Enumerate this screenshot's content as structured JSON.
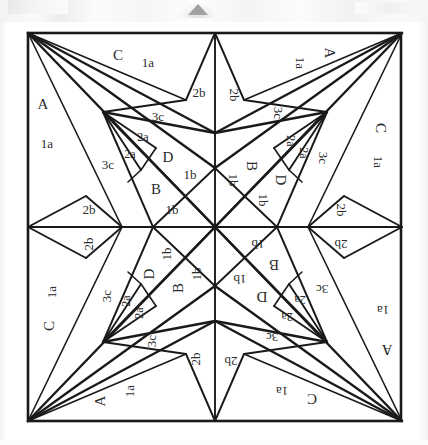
{
  "figure": {
    "square": {
      "left": 28,
      "top": 33,
      "right": 401,
      "bottom": 421
    },
    "center": {
      "x": 215,
      "y": 227
    },
    "stroke_color": "#1a1a1a",
    "label_color": "#2b2b2b",
    "background_color": "#ffffff",
    "artifact_color": "#9a9a9a"
  },
  "legend": {
    "section_letters": [
      "A",
      "B",
      "C",
      "D"
    ],
    "piece_codes": [
      "1a",
      "1b",
      "2a",
      "2b",
      "3c"
    ]
  },
  "labels": [
    {
      "id": "ul-C",
      "text": "C",
      "x": 118,
      "y": 57,
      "size": 15,
      "rot": 0
    },
    {
      "id": "ul-1a-top",
      "text": "1a",
      "x": 148,
      "y": 64,
      "size": 13,
      "rot": 0
    },
    {
      "id": "ul-2b-top",
      "text": "2b",
      "x": 199,
      "y": 94,
      "size": 13,
      "rot": 0
    },
    {
      "id": "ul-A",
      "text": "A",
      "x": 43,
      "y": 106,
      "size": 15,
      "rot": 0
    },
    {
      "id": "ul-1a-left",
      "text": "1a",
      "x": 47,
      "y": 145,
      "size": 13,
      "rot": 0
    },
    {
      "id": "ul-3c-up",
      "text": "3c",
      "x": 158,
      "y": 118,
      "size": 13,
      "rot": 0
    },
    {
      "id": "ul-2a-out",
      "text": "2a",
      "x": 143,
      "y": 138,
      "size": 12,
      "rot": 0
    },
    {
      "id": "ul-2a-in",
      "text": "2a",
      "x": 130,
      "y": 155,
      "size": 12,
      "rot": 0
    },
    {
      "id": "ul-D",
      "text": "D",
      "x": 168,
      "y": 159,
      "size": 15,
      "rot": 0
    },
    {
      "id": "ul-1b-D",
      "text": "1b",
      "x": 190,
      "y": 176,
      "size": 13,
      "rot": 0
    },
    {
      "id": "ul-3c-low",
      "text": "3c",
      "x": 108,
      "y": 166,
      "size": 13,
      "rot": 0
    },
    {
      "id": "ul-B",
      "text": "B",
      "x": 156,
      "y": 191,
      "size": 15,
      "rot": 0
    },
    {
      "id": "ul-1b-B",
      "text": "1b",
      "x": 172,
      "y": 211,
      "size": 13,
      "rot": 0
    },
    {
      "id": "ul-2b-left",
      "text": "2b",
      "x": 89,
      "y": 211,
      "size": 13,
      "rot": 0
    },
    {
      "id": "ur-A",
      "text": "A",
      "x": 328,
      "y": 53,
      "size": 15,
      "rot": 90
    },
    {
      "id": "ur-1a-top",
      "text": "1a",
      "x": 299,
      "y": 63,
      "size": 13,
      "rot": 90
    },
    {
      "id": "ur-2b-top",
      "text": "2b",
      "x": 233,
      "y": 95,
      "size": 13,
      "rot": 90
    },
    {
      "id": "ur-C",
      "text": "C",
      "x": 379,
      "y": 128,
      "size": 15,
      "rot": 90
    },
    {
      "id": "ur-1a-rt",
      "text": "1a",
      "x": 377,
      "y": 162,
      "size": 13,
      "rot": 90
    },
    {
      "id": "ur-3c-up",
      "text": "3c",
      "x": 277,
      "y": 113,
      "size": 13,
      "rot": 90
    },
    {
      "id": "ur-2a-out",
      "text": "2a",
      "x": 290,
      "y": 141,
      "size": 12,
      "rot": 90
    },
    {
      "id": "ur-2a-in",
      "text": "2a",
      "x": 303,
      "y": 153,
      "size": 12,
      "rot": 90
    },
    {
      "id": "ur-D",
      "text": "D",
      "x": 279,
      "y": 180,
      "size": 15,
      "rot": 90
    },
    {
      "id": "ur-1b-D",
      "text": "1b",
      "x": 262,
      "y": 200,
      "size": 13,
      "rot": 90
    },
    {
      "id": "ur-3c-low",
      "text": "3c",
      "x": 322,
      "y": 158,
      "size": 13,
      "rot": 90
    },
    {
      "id": "ur-B",
      "text": "B",
      "x": 250,
      "y": 166,
      "size": 15,
      "rot": 90
    },
    {
      "id": "ur-1b-B",
      "text": "1b",
      "x": 232,
      "y": 180,
      "size": 13,
      "rot": 90
    },
    {
      "id": "ur-2b-rt",
      "text": "2b",
      "x": 340,
      "y": 210,
      "size": 13,
      "rot": 90
    },
    {
      "id": "br-C",
      "text": "C",
      "x": 312,
      "y": 397,
      "size": 15,
      "rot": 180
    },
    {
      "id": "br-1a-bot",
      "text": "1a",
      "x": 282,
      "y": 390,
      "size": 13,
      "rot": 180
    },
    {
      "id": "br-2b-bot",
      "text": "2b",
      "x": 231,
      "y": 360,
      "size": 13,
      "rot": 180
    },
    {
      "id": "br-A",
      "text": "A",
      "x": 387,
      "y": 348,
      "size": 15,
      "rot": 180
    },
    {
      "id": "br-1a-rt",
      "text": "1a",
      "x": 383,
      "y": 309,
      "size": 13,
      "rot": 180
    },
    {
      "id": "br-3c-dn",
      "text": "3c",
      "x": 272,
      "y": 336,
      "size": 13,
      "rot": 180
    },
    {
      "id": "br-2a-out",
      "text": "2a",
      "x": 287,
      "y": 316,
      "size": 12,
      "rot": 180
    },
    {
      "id": "br-2a-in",
      "text": "2a",
      "x": 300,
      "y": 299,
      "size": 12,
      "rot": 180
    },
    {
      "id": "br-D",
      "text": "D",
      "x": 262,
      "y": 295,
      "size": 15,
      "rot": 180
    },
    {
      "id": "br-1b-D",
      "text": "1b",
      "x": 240,
      "y": 278,
      "size": 13,
      "rot": 180
    },
    {
      "id": "br-3c-up",
      "text": "3c",
      "x": 322,
      "y": 288,
      "size": 13,
      "rot": 180
    },
    {
      "id": "br-B",
      "text": "B",
      "x": 274,
      "y": 263,
      "size": 15,
      "rot": 180
    },
    {
      "id": "br-1b-B",
      "text": "1b",
      "x": 258,
      "y": 243,
      "size": 13,
      "rot": 180
    },
    {
      "id": "br-2b-rt",
      "text": "2b",
      "x": 341,
      "y": 243,
      "size": 13,
      "rot": 180
    },
    {
      "id": "bl-A",
      "text": "A",
      "x": 102,
      "y": 401,
      "size": 15,
      "rot": 270
    },
    {
      "id": "bl-1a-bot",
      "text": "1a",
      "x": 131,
      "y": 391,
      "size": 13,
      "rot": 270
    },
    {
      "id": "bl-2b-bot",
      "text": "2b",
      "x": 197,
      "y": 359,
      "size": 13,
      "rot": 270
    },
    {
      "id": "bl-C",
      "text": "C",
      "x": 51,
      "y": 326,
      "size": 15,
      "rot": 270
    },
    {
      "id": "bl-1a-lt",
      "text": "1a",
      "x": 53,
      "y": 292,
      "size": 13,
      "rot": 270
    },
    {
      "id": "bl-3c-dn",
      "text": "3c",
      "x": 153,
      "y": 341,
      "size": 13,
      "rot": 270
    },
    {
      "id": "bl-2a-out",
      "text": "2a",
      "x": 140,
      "y": 313,
      "size": 12,
      "rot": 270
    },
    {
      "id": "bl-2a-in",
      "text": "2a",
      "x": 127,
      "y": 301,
      "size": 12,
      "rot": 270
    },
    {
      "id": "bl-D",
      "text": "D",
      "x": 151,
      "y": 274,
      "size": 15,
      "rot": 270
    },
    {
      "id": "bl-1b-D",
      "text": "1b",
      "x": 168,
      "y": 254,
      "size": 13,
      "rot": 270
    },
    {
      "id": "bl-3c-up",
      "text": "3c",
      "x": 108,
      "y": 296,
      "size": 13,
      "rot": 270
    },
    {
      "id": "bl-B",
      "text": "B",
      "x": 180,
      "y": 288,
      "size": 15,
      "rot": 270
    },
    {
      "id": "bl-1b-B",
      "text": "1b",
      "x": 198,
      "y": 274,
      "size": 13,
      "rot": 270
    },
    {
      "id": "bl-2b-lt",
      "text": "2b",
      "x": 90,
      "y": 244,
      "size": 13,
      "rot": 270
    }
  ],
  "geometry": {
    "quadrant_ul": {
      "corner": {
        "x": 28,
        "y": 33
      },
      "star_tip": {
        "x": 103,
        "y": 112
      },
      "edge_mid_v": {
        "x": 215,
        "y": 33
      },
      "edge_mid_h": {
        "x": 28,
        "y": 227
      },
      "notch_v": {
        "x": 215,
        "y": 133
      },
      "notch_v2": {
        "x": 215,
        "y": 168
      },
      "notch_h": {
        "x": 122,
        "y": 227
      },
      "notch_h2": {
        "x": 153,
        "y": 227
      },
      "seam_top": {
        "x": 186,
        "y": 100
      },
      "seam_left": {
        "x": 86,
        "y": 196
      },
      "small_a": {
        "x": 156,
        "y": 148
      },
      "small_b": {
        "x": 141,
        "y": 170
      }
    }
  },
  "artifacts": {
    "top_triangle": {
      "x": 190,
      "y": 8,
      "width": 18,
      "height": 9
    },
    "band_height": 22
  }
}
